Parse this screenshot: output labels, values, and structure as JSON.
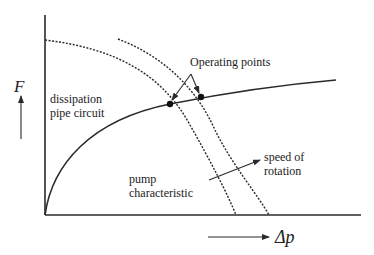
{
  "diagram": {
    "y_axis_symbol": "F",
    "x_axis_symbol": "Δp",
    "labels": {
      "operating_points": "Operating points",
      "dissipation_line1": "dissipation",
      "dissipation_line2": "pipe circuit",
      "pump_line1": "pump",
      "pump_line2": "characteristic",
      "speed_line1": "speed of",
      "speed_line2": "rotation"
    },
    "curves": [
      {
        "name": "rising solid curve",
        "style": "solid"
      },
      {
        "name": "falling curve (lower speed)",
        "style": "dotted"
      },
      {
        "name": "falling curve (higher speed)",
        "style": "dotted"
      }
    ],
    "operating_point_count": 2,
    "colors": {
      "ink": "#2a2a2a",
      "background": "#ffffff"
    }
  }
}
